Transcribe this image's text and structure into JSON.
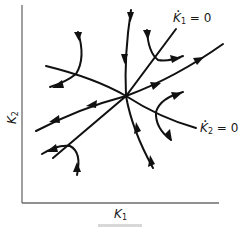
{
  "figure": {
    "type": "phase-diagram",
    "x_axis_label": "K",
    "x_axis_sub": "1",
    "y_axis_label": "K",
    "y_axis_sub": "2",
    "nullcline_1": {
      "var": "K",
      "sub": "1",
      "eq": " = 0"
    },
    "nullcline_2": {
      "var": "K",
      "sub": "2",
      "eq": " = 0"
    },
    "equilibrium": "saddle point at intersection of nullclines",
    "caption_visible": "cut off (illegible)"
  },
  "colors": {
    "line": "#111111",
    "axis": "#6b6b6b",
    "background": "#ffffff"
  }
}
